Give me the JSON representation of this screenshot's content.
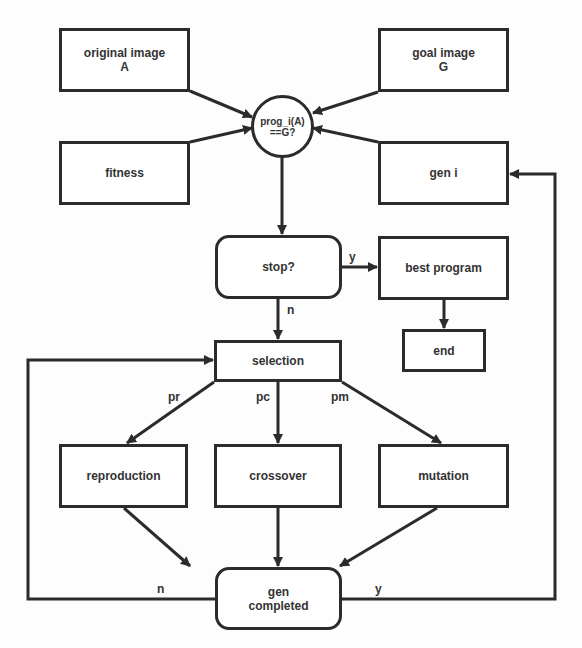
{
  "nodes": {
    "original_image": "original image\nA",
    "goal_image": "goal image\nG",
    "fitness": "fitness",
    "gen_i": "gen i",
    "check": "prog_i(A)\n==G?",
    "stop": "stop?",
    "best_program": "best program",
    "end": "end",
    "selection": "selection",
    "reproduction": "reproduction",
    "crossover": "crossover",
    "mutation": "mutation",
    "gen_completed": "gen\ncompleted"
  },
  "edge_labels": {
    "stop_yes": "y",
    "stop_no": "n",
    "pr": "pr",
    "pc": "pc",
    "pm": "pm",
    "gen_no": "n",
    "gen_yes": "y"
  },
  "colors": {
    "stroke": "#2b2b2b",
    "text": "#333333",
    "background": "#fdfdfd"
  }
}
